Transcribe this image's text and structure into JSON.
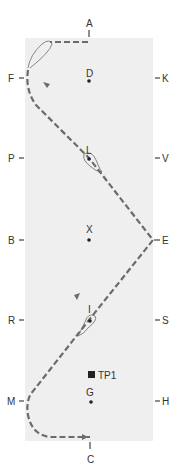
{
  "diagram": {
    "type": "dressage-arena-test-movement",
    "arena_color": "#efefef",
    "path_color": "#6b6b6b",
    "marker_color": "#222222"
  },
  "letters": {
    "A": "A",
    "C": "C",
    "F": "F",
    "K": "K",
    "P": "P",
    "V": "V",
    "B": "B",
    "E": "E",
    "R": "R",
    "S": "S",
    "M": "M",
    "H": "H"
  },
  "centerline_points": {
    "D": "D",
    "L": "L",
    "X": "X",
    "I": "I",
    "G": "G"
  },
  "test_point": {
    "label": "TP1"
  }
}
